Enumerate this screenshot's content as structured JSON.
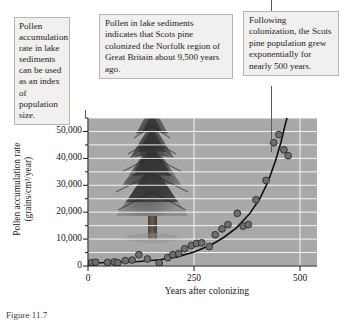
{
  "figure": {
    "caption": "Figure 11.7",
    "background_image_name": "scots-pine-tree-photo"
  },
  "callouts": {
    "left": "Pollen accumulation rate in lake sediments can be used as an index of population size.",
    "middle": "Pollen in lake sediments indicates that Scots pine colonized the Norfolk region of Great Britain about 9,500 years ago.",
    "right": "Following colonization, the Scots pine population grew exponentially for nearly 500 years."
  },
  "chart_data": {
    "type": "scatter",
    "title": "",
    "xlabel": "Years after colonizing",
    "ylabel": "Pollen accumulation rate (grains/cm²/year)",
    "xlim": [
      0,
      540
    ],
    "ylim": [
      0,
      55000
    ],
    "xticks": [
      0,
      250,
      500
    ],
    "xtick_labels": [
      "0",
      "250",
      "500"
    ],
    "yticks": [
      0,
      10000,
      20000,
      30000,
      40000,
      50000
    ],
    "ytick_labels": [
      "0",
      "10,000",
      "20,000",
      "30,000",
      "40,000",
      "50,000"
    ],
    "y_minor_tick_step": 5000,
    "grid": true,
    "grid_color": "#ffffff",
    "plot_bg_color": "#a8a8a8",
    "point_color": "#6e6e6e",
    "point_edge_color": "#2b2b2b",
    "curve_color": "#101010",
    "legend": "none",
    "points": [
      {
        "x": 8,
        "y": 1200
      },
      {
        "x": 18,
        "y": 1400
      },
      {
        "x": 46,
        "y": 1300
      },
      {
        "x": 62,
        "y": 1500
      },
      {
        "x": 70,
        "y": 1200
      },
      {
        "x": 88,
        "y": 2000
      },
      {
        "x": 104,
        "y": 2200
      },
      {
        "x": 120,
        "y": 4200
      },
      {
        "x": 140,
        "y": 2600
      },
      {
        "x": 168,
        "y": 1100
      },
      {
        "x": 188,
        "y": 3100
      },
      {
        "x": 200,
        "y": 4200
      },
      {
        "x": 214,
        "y": 4600
      },
      {
        "x": 228,
        "y": 6400
      },
      {
        "x": 244,
        "y": 7600
      },
      {
        "x": 256,
        "y": 8400
      },
      {
        "x": 268,
        "y": 8600
      },
      {
        "x": 286,
        "y": 7200
      },
      {
        "x": 300,
        "y": 11600
      },
      {
        "x": 316,
        "y": 13800
      },
      {
        "x": 330,
        "y": 15400
      },
      {
        "x": 352,
        "y": 19600
      },
      {
        "x": 366,
        "y": 14800
      },
      {
        "x": 378,
        "y": 15400
      },
      {
        "x": 396,
        "y": 24600
      },
      {
        "x": 420,
        "y": 31800
      },
      {
        "x": 438,
        "y": 45800
      },
      {
        "x": 450,
        "y": 48800
      },
      {
        "x": 462,
        "y": 43200
      },
      {
        "x": 472,
        "y": 41000
      }
    ],
    "fit_curve": {
      "name": "exponential-growth-curve",
      "description": "Exponential fit through the scatter points",
      "points": [
        {
          "x": 0,
          "y": 1100
        },
        {
          "x": 60,
          "y": 1300
        },
        {
          "x": 120,
          "y": 1700
        },
        {
          "x": 170,
          "y": 2300
        },
        {
          "x": 210,
          "y": 3400
        },
        {
          "x": 250,
          "y": 5200
        },
        {
          "x": 290,
          "y": 7800
        },
        {
          "x": 320,
          "y": 10600
        },
        {
          "x": 350,
          "y": 14200
        },
        {
          "x": 380,
          "y": 19200
        },
        {
          "x": 405,
          "y": 25000
        },
        {
          "x": 425,
          "y": 31500
        },
        {
          "x": 442,
          "y": 39000
        },
        {
          "x": 455,
          "y": 46000
        },
        {
          "x": 465,
          "y": 52500
        },
        {
          "x": 471,
          "y": 56000
        }
      ]
    }
  }
}
